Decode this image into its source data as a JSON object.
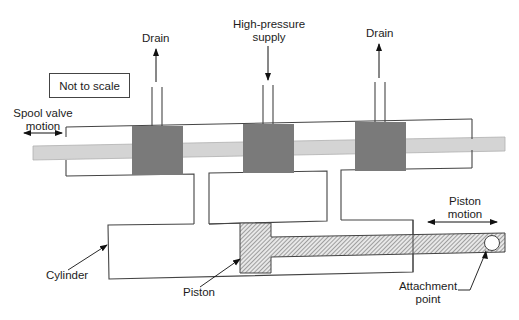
{
  "diagram": {
    "type": "spool-valve-hydraulic-actuator",
    "note": "Not to scale",
    "labels": {
      "drain_left": "Drain",
      "supply_line1": "High-pressure",
      "supply_line2": "supply",
      "drain_right": "Drain",
      "spool_motion_line1": "Spool valve",
      "spool_motion_line2": "motion",
      "piston_motion_line1": "Piston",
      "piston_motion_line2": "motion",
      "cylinder": "Cylinder",
      "piston": "Piston",
      "attachment_line1": "Attachment",
      "attachment_line2": "point"
    },
    "colors": {
      "line": "#444444",
      "land_fill": "#7a7a7a",
      "spool_fill": "#d4d4d4",
      "hatch": "#555555",
      "background": "#ffffff"
    },
    "components": [
      "valve-body",
      "spool",
      "land-1",
      "land-2",
      "land-3",
      "drain-port-left",
      "supply-port",
      "drain-port-right",
      "cylinder",
      "piston-head",
      "piston-rod",
      "attachment-point"
    ]
  }
}
